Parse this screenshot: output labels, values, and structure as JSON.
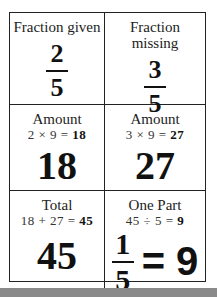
{
  "cells": {
    "fraction_given": {
      "label": "Fraction given",
      "numerator": "2",
      "denominator": "5"
    },
    "fraction_missing": {
      "label": "Fraction missing",
      "numerator": "3",
      "denominator": "5"
    },
    "amount_given": {
      "label": "Amount",
      "eq_prefix": "2 × 9 = ",
      "eq_result": "18",
      "value": "18"
    },
    "amount_missing": {
      "label": "Amount",
      "eq_prefix": "3 × 9 = ",
      "eq_result": "27",
      "value": "27"
    },
    "total": {
      "label": "Total",
      "eq_prefix": "18 + 27 = ",
      "eq_result": "45",
      "value": "45"
    },
    "one_part": {
      "label": "One Part",
      "eq_prefix": "45 ÷ 5 = ",
      "eq_result": "9",
      "numerator": "1",
      "denominator": "5",
      "result": "= 9"
    }
  },
  "colors": {
    "border": "#222222",
    "footer_bar": "#8a8a8a"
  }
}
